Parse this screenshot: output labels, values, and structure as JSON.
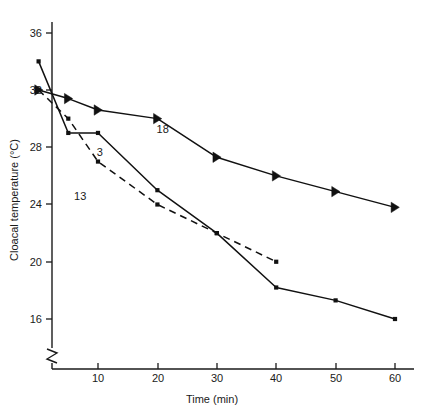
{
  "chart_data": {
    "type": "line",
    "title": "",
    "xlabel": "Time (min)",
    "ylabel": "Cloacal temperature (°C)",
    "xlim": [
      0,
      64
    ],
    "ylim": [
      14.2,
      37.2
    ],
    "xticks": [
      10,
      20,
      30,
      40,
      50,
      60
    ],
    "xtick_labels": [
      "10",
      "20",
      "30",
      "40",
      "50",
      "60"
    ],
    "yticks": [
      16,
      20,
      24,
      28,
      32,
      36
    ],
    "ytick_labels": [
      "16",
      "20",
      "24",
      "28",
      "32",
      "36"
    ],
    "grid": false,
    "legend": "inline-annotations",
    "y_axis_break": true,
    "series": [
      {
        "name": "18",
        "label": "18",
        "linestyle": "solid",
        "marker": "right-triangle",
        "label_position": {
          "x": 20.9,
          "y": 29.0
        },
        "x": [
          0,
          5,
          10,
          20,
          30,
          40,
          50,
          60
        ],
        "values": [
          32.0,
          31.4,
          30.6,
          30.0,
          27.3,
          26.0,
          24.9,
          23.8
        ]
      },
      {
        "name": "3",
        "label": "3",
        "linestyle": "solid",
        "marker": "square-dot",
        "label_position": {
          "x": 10.3,
          "y": 27.4
        },
        "x": [
          0,
          5,
          10,
          20,
          30,
          40,
          50,
          60
        ],
        "values": [
          34.0,
          29.0,
          29.0,
          25.0,
          22.0,
          18.2,
          17.3,
          16.0
        ]
      },
      {
        "name": "13",
        "label": "13",
        "linestyle": "dashed",
        "marker": "square-dot",
        "label_position": {
          "x": 7.0,
          "y": 24.3
        },
        "x": [
          0,
          5,
          10,
          20,
          30,
          40
        ],
        "values": [
          32.0,
          30.0,
          27.0,
          24.0,
          22.0,
          20.0
        ]
      }
    ]
  },
  "axes": {
    "x_title": "Time (min)",
    "y_title": "Cloacal temperature (°C)"
  },
  "colors": {
    "ink": "#111111",
    "background": "#ffffff"
  }
}
